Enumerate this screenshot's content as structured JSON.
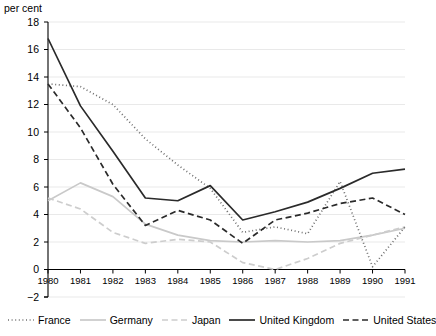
{
  "chart_data": {
    "type": "line",
    "title": "",
    "subtitle": "",
    "xlabel": "",
    "ylabel": "per cent",
    "unit_label": "per cent",
    "grid": true,
    "legend_position": "bottom",
    "xlim": [
      1980,
      1991
    ],
    "ylim": [
      -2,
      18
    ],
    "ytick_step": 2,
    "categories": [
      "1980",
      "1981",
      "1982",
      "1983",
      "1984",
      "1985",
      "1986",
      "1987",
      "1988",
      "1989",
      "1990",
      "1991"
    ],
    "x": [
      1980,
      1981,
      1982,
      1983,
      1984,
      1985,
      1986,
      1987,
      1988,
      1989,
      1990,
      1991
    ],
    "yticks": [
      "18",
      "16",
      "14",
      "12",
      "10",
      "8",
      "6",
      "4",
      "2",
      "0",
      "-2"
    ],
    "ytick_values": [
      18,
      16,
      14,
      12,
      10,
      8,
      6,
      4,
      2,
      0,
      -2
    ],
    "series": [
      {
        "name": "France",
        "style": "dotted",
        "color": "#6e6e6e",
        "values": [
          13.5,
          13.3,
          12.0,
          9.5,
          7.6,
          5.9,
          2.7,
          3.1,
          2.6,
          6.4,
          0.2,
          3.1
        ]
      },
      {
        "name": "Germany",
        "style": "solid",
        "color": "#c9c9c9",
        "values": [
          5.0,
          6.3,
          5.3,
          3.3,
          2.5,
          2.1,
          2.0,
          2.1,
          2.0,
          2.1,
          2.5,
          3.0
        ]
      },
      {
        "name": "Japan",
        "style": "dashed",
        "color": "#cdcdcd",
        "values": [
          5.2,
          4.4,
          2.7,
          1.9,
          2.2,
          2.0,
          0.5,
          0.0,
          0.8,
          1.9,
          2.5,
          3.1
        ]
      },
      {
        "name": "United Kingdom",
        "style": "solid",
        "color": "#2a2a2a",
        "values": [
          16.8,
          11.9,
          8.6,
          5.2,
          5.0,
          6.1,
          3.6,
          4.2,
          4.9,
          5.9,
          7.0,
          7.3
        ]
      },
      {
        "name": "United States",
        "style": "dashed",
        "color": "#2a2a2a",
        "values": [
          13.5,
          10.3,
          6.2,
          3.2,
          4.3,
          3.6,
          1.9,
          3.6,
          4.1,
          4.8,
          5.2,
          4.0
        ]
      }
    ]
  },
  "legend": {
    "items": [
      {
        "label": "France"
      },
      {
        "label": "Germany"
      },
      {
        "label": "Japan"
      },
      {
        "label": "United Kingdom"
      },
      {
        "label": "United States"
      }
    ]
  }
}
